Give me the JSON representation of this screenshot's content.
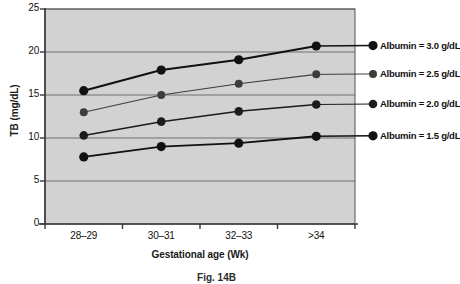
{
  "figure": {
    "caption": "Fig. 14B"
  },
  "chart_data": {
    "type": "line",
    "title": "",
    "subtitle": "",
    "xlabel": "Gestational age (Wk)",
    "ylabel": "TB (mg/dL)",
    "categories": [
      "28–29",
      "30–31",
      "32–33",
      ">34"
    ],
    "ylim": [
      0,
      25
    ],
    "yticks": [
      0,
      5,
      10,
      15,
      20,
      25
    ],
    "ytick_labels": [
      "0",
      "5",
      "10",
      "15",
      "20",
      "25"
    ],
    "grid": "horizontal",
    "legend_position": "inline-right",
    "plot_background": "#d2d2d2",
    "page_background": "#ffffff",
    "axis_color": "#3a3a3a",
    "gridline_color": "#6e6e6e",
    "series": [
      {
        "name": "Albumin = 3.0 g/dL",
        "label": "Albumin = 3.0 g/dL",
        "values": [
          15.5,
          17.9,
          19.1,
          20.7
        ],
        "color": "#111111",
        "line_width": 2.0,
        "marker": "circle",
        "marker_size": 4.6
      },
      {
        "name": "Albumin = 2.5 g/dL",
        "label": "Albumin = 2.5 g/dL",
        "values": [
          13.0,
          15.0,
          16.3,
          17.4
        ],
        "color": "#3d3d3d",
        "line_width": 1.1,
        "marker": "circle",
        "marker_size": 4.0
      },
      {
        "name": "Albumin = 2.0 g/dL",
        "label": "Albumin = 2.0 g/dL",
        "values": [
          10.3,
          11.9,
          13.1,
          13.9
        ],
        "color": "#1c1c1c",
        "line_width": 1.5,
        "marker": "circle",
        "marker_size": 4.3
      },
      {
        "name": "Albumin = 1.5 g/dL",
        "label": "Albumin = 1.5 g/dL",
        "values": [
          7.8,
          9.0,
          9.4,
          10.2
        ],
        "color": "#111111",
        "line_width": 1.9,
        "marker": "circle",
        "marker_size": 4.6
      }
    ]
  }
}
